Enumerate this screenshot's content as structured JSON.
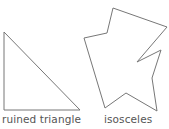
{
  "figures": [
    {
      "label": "ruined triangle",
      "stroke": "#777777",
      "points": [
        [
          4,
          32
        ],
        [
          4,
          110
        ],
        [
          80,
          110
        ]
      ]
    },
    {
      "label": "isosceles",
      "stroke": "#777777",
      "points": [
        [
          113,
          8
        ],
        [
          167,
          27
        ],
        [
          137,
          62
        ],
        [
          161,
          50
        ],
        [
          152,
          78
        ],
        [
          157,
          111
        ],
        [
          126,
          93
        ],
        [
          105,
          108
        ],
        [
          84,
          38
        ],
        [
          107,
          33
        ]
      ]
    }
  ]
}
